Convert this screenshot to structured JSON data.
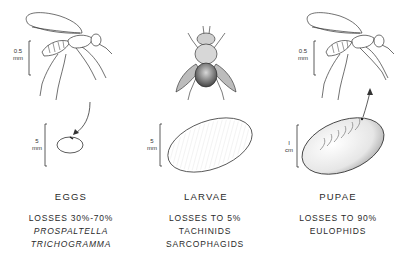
{
  "figure": {
    "stages": [
      {
        "id": "eggs",
        "title": "EGGS",
        "losses": "LOSSES 30%-70%",
        "parasitoids": [
          "PROSPALTELLA",
          "TRICHOGRAMMA"
        ],
        "parasitoids_italic": true,
        "adult_illustration": "wasp-icon",
        "adult_scale": {
          "value": "0.5",
          "unit": "mm"
        },
        "stage_illustration": "egg-icon",
        "stage_scale": {
          "value": "5",
          "unit": "mm"
        }
      },
      {
        "id": "larvae",
        "title": "LARVAE",
        "losses": "LOSSES TO 5%",
        "parasitoids": [
          "TACHINIDS",
          "SARCOPHAGIDS"
        ],
        "parasitoids_italic": false,
        "adult_illustration": "fly-icon",
        "stage_illustration": "larva-icon",
        "stage_scale": {
          "value": "5",
          "unit": "mm"
        }
      },
      {
        "id": "pupae",
        "title": "PUPAE",
        "losses": "LOSSES TO 90%",
        "parasitoids": [
          "EULOPHIDS"
        ],
        "parasitoids_italic": false,
        "adult_illustration": "wasp-icon",
        "adult_scale": {
          "value": "0.5",
          "unit": "mm"
        },
        "stage_illustration": "pupa-icon",
        "stage_scale": {
          "value": "I",
          "unit": "cm"
        }
      }
    ]
  }
}
